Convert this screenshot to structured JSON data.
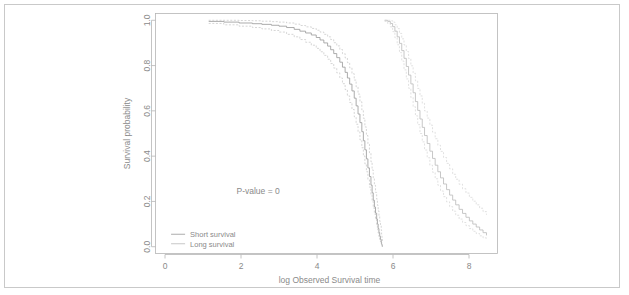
{
  "chart_data": {
    "type": "line",
    "title": "",
    "subtitle": "",
    "xlabel": "log Observed Survival time",
    "ylabel": "Survival probability",
    "xlim": [
      -0.25,
      8.75
    ],
    "ylim": [
      -0.03,
      1.03
    ],
    "xticks": [
      0,
      2,
      4,
      6,
      8
    ],
    "xticklabels": [
      "0",
      "2",
      "4",
      "6",
      "8"
    ],
    "yticks": [
      0.0,
      0.2,
      0.4,
      0.6,
      0.8,
      1.0
    ],
    "yticklabels": [
      "0.0",
      "0.2",
      "0.4",
      "0.6",
      "0.8",
      "1.0"
    ],
    "grid": false,
    "legend_position": "bottom-left",
    "annotations": [
      {
        "text": "P-value = 0",
        "x": 2.45,
        "y": 0.235
      }
    ],
    "legend": [
      {
        "name": "Short survival",
        "style": "solid",
        "color": "#9d9d9d"
      },
      {
        "name": "Long survival",
        "style": "solid",
        "color": "#bdbdbd"
      }
    ],
    "series": [
      {
        "name": "Short survival",
        "style": "solid",
        "color": "#9d9d9d",
        "type": "step",
        "x": [
          1.15,
          1.55,
          1.95,
          2.3,
          2.55,
          2.8,
          3.0,
          3.2,
          3.4,
          3.55,
          3.7,
          3.85,
          3.98,
          4.08,
          4.18,
          4.28,
          4.36,
          4.44,
          4.52,
          4.6,
          4.67,
          4.74,
          4.8,
          4.86,
          4.92,
          4.98,
          5.03,
          5.08,
          5.13,
          5.18,
          5.22,
          5.26,
          5.3,
          5.34,
          5.38,
          5.42,
          5.45,
          5.48,
          5.51,
          5.54,
          5.57,
          5.59,
          5.61,
          5.63,
          5.65,
          5.67,
          5.69,
          5.7,
          5.71,
          5.72
        ],
        "y": [
          0.995,
          0.992,
          0.988,
          0.985,
          0.982,
          0.978,
          0.974,
          0.968,
          0.96,
          0.952,
          0.944,
          0.935,
          0.924,
          0.913,
          0.9,
          0.886,
          0.87,
          0.853,
          0.835,
          0.815,
          0.793,
          0.77,
          0.745,
          0.718,
          0.688,
          0.656,
          0.622,
          0.586,
          0.548,
          0.508,
          0.468,
          0.428,
          0.388,
          0.348,
          0.31,
          0.272,
          0.238,
          0.205,
          0.175,
          0.148,
          0.122,
          0.1,
          0.08,
          0.062,
          0.046,
          0.032,
          0.02,
          0.012,
          0.005,
          0.0
        ]
      },
      {
        "name": "Short survival upper CI",
        "style": "dashed",
        "color": "#c4c4c4",
        "type": "step",
        "x": [
          1.15,
          1.55,
          1.95,
          2.3,
          2.55,
          2.8,
          3.0,
          3.2,
          3.4,
          3.55,
          3.7,
          3.85,
          3.98,
          4.08,
          4.18,
          4.28,
          4.36,
          4.44,
          4.52,
          4.6,
          4.67,
          4.74,
          4.8,
          4.86,
          4.92,
          4.98,
          5.03,
          5.08,
          5.13,
          5.18,
          5.22,
          5.26,
          5.3,
          5.34,
          5.38,
          5.42,
          5.45,
          5.48,
          5.51,
          5.54,
          5.57,
          5.59,
          5.61,
          5.63,
          5.65,
          5.67,
          5.69,
          5.7,
          5.71,
          5.72
        ],
        "y": [
          1.0,
          1.0,
          0.999,
          0.998,
          0.996,
          0.994,
          0.992,
          0.988,
          0.983,
          0.977,
          0.971,
          0.964,
          0.956,
          0.948,
          0.938,
          0.927,
          0.915,
          0.901,
          0.887,
          0.871,
          0.853,
          0.834,
          0.813,
          0.79,
          0.764,
          0.736,
          0.706,
          0.674,
          0.64,
          0.604,
          0.567,
          0.529,
          0.491,
          0.452,
          0.414,
          0.375,
          0.339,
          0.304,
          0.271,
          0.24,
          0.21,
          0.183,
          0.158,
          0.134,
          0.112,
          0.092,
          0.073,
          0.056,
          0.04,
          0.024
        ]
      },
      {
        "name": "Short survival lower CI",
        "style": "dashed",
        "color": "#c4c4c4",
        "type": "step",
        "x": [
          1.15,
          1.55,
          1.95,
          2.3,
          2.55,
          2.8,
          3.0,
          3.2,
          3.4,
          3.55,
          3.7,
          3.85,
          3.98,
          4.08,
          4.18,
          4.28,
          4.36,
          4.44,
          4.52,
          4.6,
          4.67,
          4.74,
          4.8,
          4.86,
          4.92,
          4.98,
          5.03,
          5.08,
          5.13,
          5.18,
          5.22,
          5.26,
          5.3,
          5.34,
          5.38,
          5.42,
          5.45,
          5.48,
          5.51,
          5.54,
          5.57,
          5.59,
          5.61,
          5.63,
          5.65,
          5.67,
          5.69,
          5.7,
          5.71,
          5.72
        ],
        "y": [
          0.986,
          0.98,
          0.974,
          0.968,
          0.962,
          0.955,
          0.948,
          0.938,
          0.927,
          0.915,
          0.903,
          0.89,
          0.876,
          0.861,
          0.845,
          0.828,
          0.809,
          0.789,
          0.768,
          0.745,
          0.72,
          0.694,
          0.666,
          0.637,
          0.606,
          0.574,
          0.541,
          0.507,
          0.472,
          0.437,
          0.401,
          0.366,
          0.331,
          0.296,
          0.263,
          0.231,
          0.2,
          0.171,
          0.144,
          0.119,
          0.097,
          0.077,
          0.06,
          0.045,
          0.032,
          0.021,
          0.012,
          0.006,
          0.002,
          0.0
        ]
      },
      {
        "name": "Long survival",
        "style": "solid",
        "color": "#bdbdbd",
        "type": "step",
        "x": [
          5.78,
          5.86,
          5.93,
          5.99,
          6.05,
          6.11,
          6.17,
          6.23,
          6.29,
          6.35,
          6.41,
          6.47,
          6.53,
          6.59,
          6.65,
          6.71,
          6.77,
          6.83,
          6.9,
          6.97,
          7.04,
          7.11,
          7.18,
          7.25,
          7.33,
          7.41,
          7.49,
          7.57,
          7.65,
          7.74,
          7.83,
          7.92,
          8.01,
          8.1,
          8.19,
          8.28,
          8.37,
          8.46
        ],
        "y": [
          1.0,
          0.995,
          0.986,
          0.972,
          0.952,
          0.927,
          0.898,
          0.866,
          0.832,
          0.796,
          0.758,
          0.719,
          0.68,
          0.641,
          0.602,
          0.564,
          0.527,
          0.491,
          0.456,
          0.422,
          0.39,
          0.36,
          0.331,
          0.304,
          0.277,
          0.252,
          0.228,
          0.206,
          0.185,
          0.165,
          0.147,
          0.13,
          0.114,
          0.1,
          0.087,
          0.074,
          0.062,
          0.05
        ]
      },
      {
        "name": "Long survival upper CI",
        "style": "dashed",
        "color": "#d4d4d4",
        "type": "step",
        "x": [
          5.78,
          5.86,
          5.93,
          5.99,
          6.05,
          6.11,
          6.17,
          6.23,
          6.29,
          6.35,
          6.41,
          6.47,
          6.53,
          6.59,
          6.65,
          6.71,
          6.77,
          6.83,
          6.9,
          6.97,
          7.04,
          7.11,
          7.18,
          7.25,
          7.33,
          7.41,
          7.49,
          7.57,
          7.65,
          7.74,
          7.83,
          7.92,
          8.01,
          8.1,
          8.19,
          8.28,
          8.37,
          8.46
        ],
        "y": [
          1.0,
          1.0,
          0.998,
          0.992,
          0.98,
          0.963,
          0.942,
          0.918,
          0.891,
          0.862,
          0.831,
          0.799,
          0.766,
          0.733,
          0.699,
          0.666,
          0.633,
          0.6,
          0.568,
          0.537,
          0.506,
          0.477,
          0.448,
          0.421,
          0.394,
          0.368,
          0.344,
          0.32,
          0.298,
          0.276,
          0.256,
          0.237,
          0.218,
          0.201,
          0.185,
          0.17,
          0.155,
          0.141
        ]
      },
      {
        "name": "Long survival lower CI",
        "style": "dashed",
        "color": "#d4d4d4",
        "type": "step",
        "x": [
          5.78,
          5.86,
          5.93,
          5.99,
          6.05,
          6.11,
          6.17,
          6.23,
          6.29,
          6.35,
          6.41,
          6.47,
          6.53,
          6.59,
          6.65,
          6.71,
          6.77,
          6.83,
          6.9,
          6.97,
          7.04,
          7.11,
          7.18,
          7.25,
          7.33,
          7.41,
          7.49,
          7.57,
          7.65,
          7.74,
          7.83,
          7.92,
          8.01,
          8.1,
          8.19,
          8.28,
          8.37,
          8.46
        ],
        "y": [
          0.995,
          0.986,
          0.971,
          0.95,
          0.923,
          0.892,
          0.857,
          0.82,
          0.781,
          0.741,
          0.7,
          0.659,
          0.618,
          0.578,
          0.539,
          0.5,
          0.463,
          0.427,
          0.393,
          0.36,
          0.329,
          0.3,
          0.272,
          0.246,
          0.221,
          0.198,
          0.177,
          0.157,
          0.139,
          0.122,
          0.107,
          0.093,
          0.08,
          0.068,
          0.058,
          0.048,
          0.039,
          0.031
        ]
      }
    ]
  }
}
